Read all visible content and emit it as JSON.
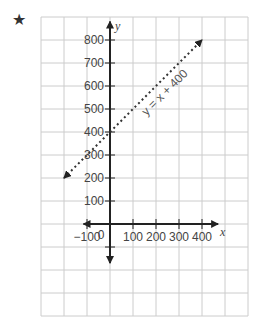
{
  "marker": {
    "icon": "star-icon",
    "glyph": "★"
  },
  "chart_data": {
    "type": "line",
    "title": "",
    "xlabel": "x",
    "ylabel": "y",
    "xlim": [
      -300,
      600
    ],
    "ylim": [
      -300,
      900
    ],
    "grid": true,
    "grid_step": 100,
    "x_ticks": [
      -100,
      100,
      200,
      300,
      400
    ],
    "x_tick_labels": [
      "−100",
      "100",
      "200",
      "300",
      "400"
    ],
    "y_ticks": [
      100,
      200,
      300,
      400,
      500,
      600,
      700,
      800
    ],
    "y_tick_labels": [
      "100",
      "200",
      "300",
      "400",
      "500",
      "600",
      "700",
      "800"
    ],
    "origin_label": "0",
    "series": [
      {
        "name": "y = x + 400",
        "style": "dotted",
        "arrows": "both",
        "x": [
          -200,
          400
        ],
        "y": [
          200,
          800
        ]
      }
    ],
    "annotations": [
      {
        "text": "y = x + 400",
        "x": 250,
        "y": 560,
        "rotation": -45
      }
    ],
    "colors": {
      "grid": "#cccccc",
      "axis": "#222222",
      "line": "#333333",
      "text": "#444444"
    }
  }
}
